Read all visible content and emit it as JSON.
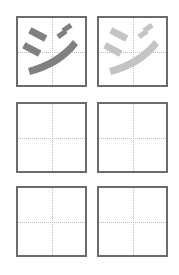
{
  "worksheet": {
    "character": "ジ",
    "rows": [
      [
        {
          "type": "model",
          "stroke_color": "#808080"
        },
        {
          "type": "trace",
          "stroke_color": "#c4c4c4"
        }
      ],
      [
        {
          "type": "blank"
        },
        {
          "type": "blank"
        }
      ],
      [
        {
          "type": "blank"
        },
        {
          "type": "blank"
        }
      ]
    ]
  }
}
